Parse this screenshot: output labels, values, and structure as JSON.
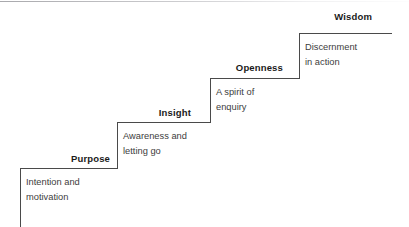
{
  "diagram": {
    "type": "staircase",
    "title": "",
    "steps": [
      {
        "label": "Purpose",
        "description_line1": "Intention and",
        "description_line2": "motivation"
      },
      {
        "label": "Insight",
        "description_line1": "Awareness and",
        "description_line2": "letting go"
      },
      {
        "label": "Openness",
        "description_line1": "A spirit of",
        "description_line2": "enquiry"
      },
      {
        "label": "Wisdom",
        "description_line1": "Discernment",
        "description_line2": "in action"
      }
    ],
    "colors": {
      "background": "#ffffff",
      "line": "#4a4a4a",
      "label_text": "#1a1a1a",
      "description_text": "#3d3d3d"
    }
  }
}
